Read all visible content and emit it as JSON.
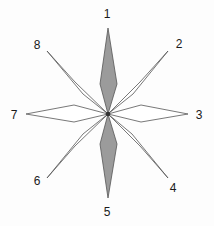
{
  "figure": {
    "background_color": "#fdfdfd",
    "center": {
      "x": 108,
      "y": 114
    },
    "stroke_color": "#555555",
    "filled_color": "#9b9b9b",
    "open_color": "#ffffff",
    "label_color": "#1a1a1a"
  },
  "chart_data": {
    "type": "pie",
    "xlabel": "",
    "ylabel": "",
    "legend_position": "none",
    "grid": false,
    "categories": [
      "1",
      "2",
      "3",
      "4",
      "5",
      "6",
      "7",
      "8"
    ],
    "values": [
      1,
      1,
      1,
      1,
      1,
      1,
      1,
      1
    ],
    "annotations": [
      "Eight kite-shaped rays radiate from a common center point",
      "Rays 1 and 5 (vertical axis) are filled gray",
      "Rays 2, 3, 4, 6, 7 and 8 are unfilled white with outlines",
      "Numbers label each ray tip clockwise starting at the top"
    ],
    "series": [
      {
        "name": "ray-length",
        "values": [
          100,
          100,
          82,
          100,
          100,
          100,
          100,
          100
        ]
      }
    ]
  },
  "points": [
    {
      "id": 1,
      "label": "1",
      "angle_deg": 90,
      "fill": "filled",
      "label_x": 107,
      "label_y": 14,
      "tip_x": 108,
      "tip_y": 28
    },
    {
      "id": 2,
      "label": "2",
      "angle_deg": 45,
      "fill": "open",
      "label_x": 179,
      "label_y": 44,
      "tip_x": 168,
      "tip_y": 51
    },
    {
      "id": 3,
      "label": "3",
      "angle_deg": 0,
      "fill": "open",
      "label_x": 199,
      "label_y": 115,
      "tip_x": 188,
      "tip_y": 114
    },
    {
      "id": 4,
      "label": "4",
      "angle_deg": 315,
      "fill": "open",
      "label_x": 173,
      "label_y": 188,
      "tip_x": 168,
      "tip_y": 178
    },
    {
      "id": 5,
      "label": "5",
      "angle_deg": 270,
      "fill": "filled",
      "label_x": 107,
      "label_y": 212,
      "tip_x": 108,
      "tip_y": 198
    },
    {
      "id": 6,
      "label": "6",
      "angle_deg": 225,
      "fill": "open",
      "label_x": 37,
      "label_y": 181,
      "tip_x": 47,
      "tip_y": 178
    },
    {
      "id": 7,
      "label": "7",
      "angle_deg": 180,
      "fill": "open",
      "label_x": 14,
      "label_y": 115,
      "tip_x": 26,
      "tip_y": 114
    },
    {
      "id": 8,
      "label": "8",
      "angle_deg": 135,
      "fill": "open",
      "label_x": 37,
      "label_y": 45,
      "tip_x": 47,
      "tip_y": 51
    }
  ],
  "geometry": {
    "rays": [
      {
        "id": 1,
        "fill": "filled",
        "path": "M 108 114 L 100 84 L 108 28 L 117 84 Z"
      },
      {
        "id": 2,
        "fill": "open",
        "path": "M 108 114 L 133 94 L 168 51 L 140 82 Z"
      },
      {
        "id": 3,
        "fill": "open",
        "path": "M 108 114 L 141 105 L 188 114 L 141 122 Z"
      },
      {
        "id": 4,
        "fill": "open",
        "path": "M 108 114 L 140 146 L 168 178 L 132 134 Z"
      },
      {
        "id": 5,
        "fill": "filled",
        "path": "M 108 114 L 117 144 L 108 198 L 100 144 Z"
      },
      {
        "id": 6,
        "fill": "open",
        "path": "M 108 114 L 83 134 L 47 178 L 75 146 Z"
      },
      {
        "id": 7,
        "fill": "open",
        "path": "M 108 114 L 74 122 L 26 114 L 74 105 Z"
      },
      {
        "id": 8,
        "fill": "open",
        "path": "M 108 114 L 75 82 L 47 51 L 83 94 Z"
      }
    ]
  }
}
